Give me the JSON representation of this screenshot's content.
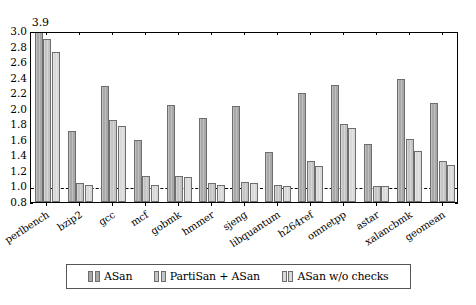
{
  "chart_data": {
    "type": "bar",
    "title": "",
    "xlabel": "",
    "ylabel": "",
    "ylim": [
      0.8,
      3.0
    ],
    "ytick_labels": [
      "0.8",
      "1.0",
      "1.2",
      "1.4",
      "1.6",
      "1.8",
      "2.0",
      "2.2",
      "2.4",
      "2.6",
      "2.8",
      "3.0"
    ],
    "ytick_values": [
      0.8,
      1.0,
      1.2,
      1.4,
      1.6,
      1.8,
      2.0,
      2.2,
      2.4,
      2.6,
      2.8,
      3.0
    ],
    "grid": false,
    "legend_position": "below",
    "reference_line": {
      "value": 1.0,
      "style": "dashed"
    },
    "categories": [
      "perlbench",
      "bzip2",
      "gcc",
      "mcf",
      "gobmk",
      "hmmer",
      "sjeng",
      "libquantum",
      "h264ref",
      "omnetpp",
      "astar",
      "xalancbmk",
      "geomean"
    ],
    "series": [
      {
        "name": "ASan",
        "color": "#a8a8a8",
        "values": [
          3.9,
          1.71,
          2.29,
          1.6,
          2.05,
          1.88,
          2.04,
          1.44,
          2.2,
          2.3,
          1.55,
          2.38,
          2.07
        ]
      },
      {
        "name": "PartiSan + ASan",
        "color": "#c4c4c4",
        "values": [
          2.9,
          1.05,
          1.86,
          1.14,
          1.13,
          1.04,
          1.06,
          1.02,
          1.33,
          1.8,
          1.01,
          1.61,
          1.33
        ]
      },
      {
        "name": "ASan w/o checks",
        "color": "#d9d9d9",
        "values": [
          2.73,
          1.02,
          1.78,
          1.02,
          1.12,
          1.02,
          1.04,
          1.01,
          1.26,
          1.75,
          1.0,
          1.46,
          1.27
        ]
      }
    ],
    "annotations": [
      {
        "text": "3.9",
        "category": "perlbench",
        "series": "ASan",
        "note": "value clipped at axis top"
      }
    ]
  },
  "legend": {
    "entries": [
      {
        "label": "ASan"
      },
      {
        "label": "PartiSan + ASan"
      },
      {
        "label": "ASan w/o checks"
      }
    ]
  }
}
